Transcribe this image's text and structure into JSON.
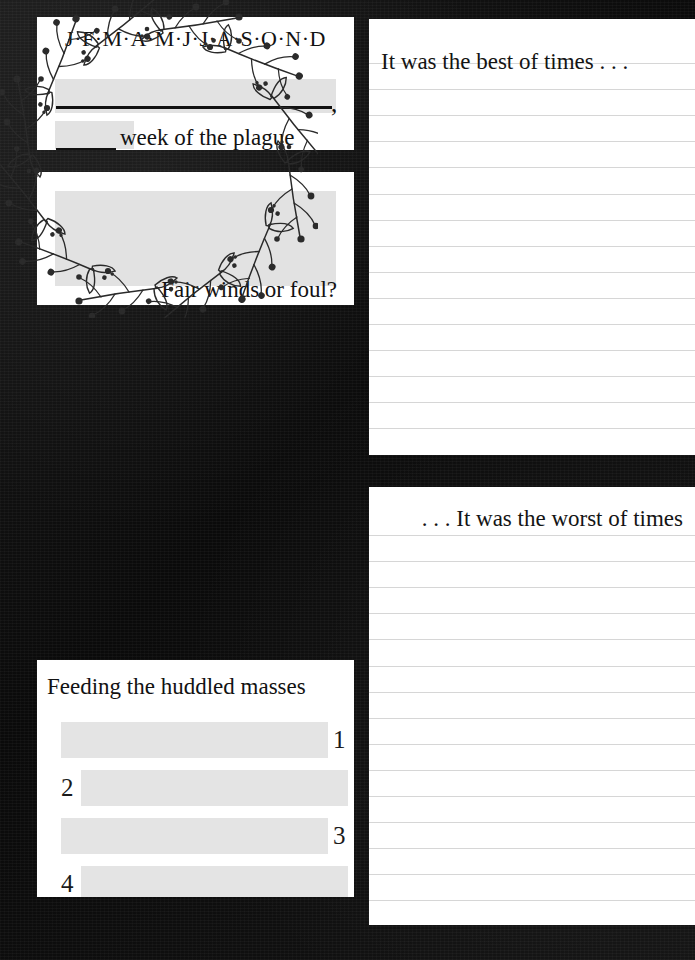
{
  "background": {
    "color": "#101010",
    "texture": "scanned-dark-paper"
  },
  "palette": {
    "card": "#ffffff",
    "fill_grey": "#e2e2e2",
    "rule_line": "#d6d6d6",
    "ink": "#121212"
  },
  "months_card": {
    "title": "J·F·M·A·M·J·J·A·S·O·N·D",
    "comma": ",",
    "week_label": "week of the plague",
    "write_lines": 2
  },
  "winds_card": {
    "label": "Fair winds or foul?"
  },
  "wreath_card": {
    "icon": "floral-wreath-icon",
    "description": "botanical sprig wreath border inside white circle"
  },
  "feeding_card": {
    "title": "Feeding the huddled masses",
    "rows": [
      {
        "number": "1",
        "align": "bar-left"
      },
      {
        "number": "2",
        "align": "bar-right"
      },
      {
        "number": "3",
        "align": "bar-left"
      },
      {
        "number": "4",
        "align": "bar-right"
      }
    ]
  },
  "best_panel": {
    "heading": "It was the best of times . . .",
    "rule_count": 15
  },
  "worst_panel": {
    "heading": ". . . It was the worst of times",
    "rule_count": 15
  }
}
